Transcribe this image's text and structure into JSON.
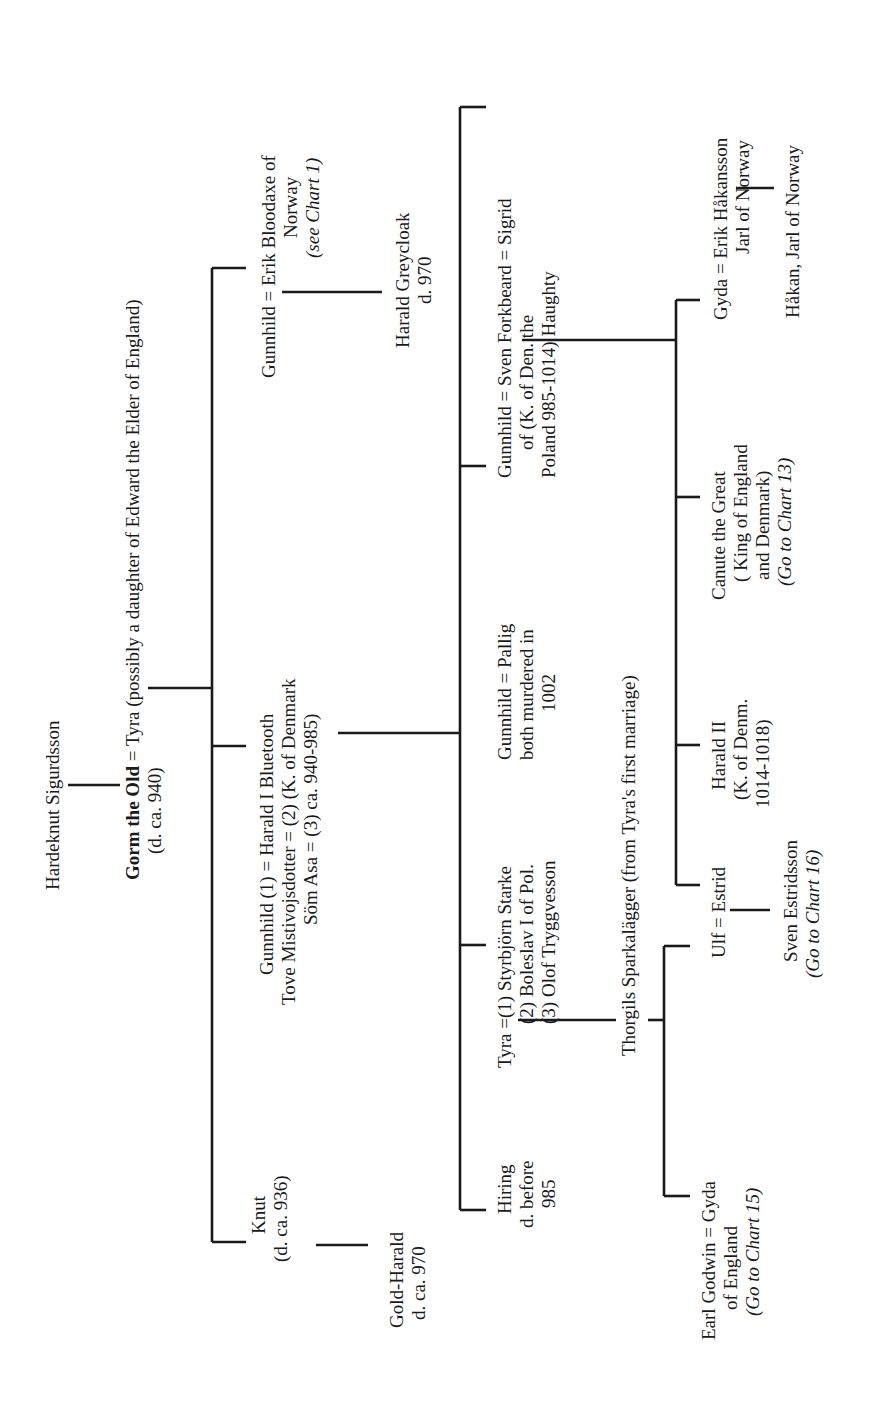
{
  "chart": {
    "type": "genealogy-tree",
    "orientation": "rotated 90 degrees counter-clockwise",
    "line_color": "#1a1a1a",
    "background": "#ffffff"
  },
  "nodes": {
    "hardeknut": {
      "lines": [
        "Hardeknut Sigurdsson"
      ]
    },
    "gorm": {
      "name": "Gorm the Old",
      "eq": "=",
      "spouse": "Tyra (possibly a daughter of Edward the Elder of England)",
      "sub": "(d. ca. 940)"
    },
    "gunnhild_erik": {
      "lines": [
        "Gunnhild = Erik Bloodaxe of",
        "Norway",
        "(see Chart 1)"
      ]
    },
    "harald_greycloak": {
      "lines": [
        "Harald Greycloak",
        "d. 970"
      ]
    },
    "harald_bluetooth": {
      "lines": [
        "Gunnhild (1)  =  Harald I  Bluetooth",
        "Tove Mistivojsdotter = (2)      (K. of Denmark",
        "Söm Asa = (3)       ca. 940-985)"
      ]
    },
    "knut": {
      "lines": [
        "Knut",
        "(d. ca. 936)"
      ]
    },
    "gold_harald": {
      "lines": [
        "Gold-Harald",
        "d. ca. 970"
      ]
    },
    "sven_forkbeard": {
      "lines": [
        "Gunnhild  =  Sven Forkbeard  = Sigrid",
        "of          (K. of Den.          the",
        "Poland          985-1014)       Haughty"
      ]
    },
    "gunnhild_pallig": {
      "lines": [
        "Gunnhild = Pallig",
        "both murdered in",
        "1002"
      ]
    },
    "tyra_marriages": {
      "lines": [
        "Tyra =(1)  Styrbjörn  Starke",
        "(2) Boleslav I  of Pol.",
        "(3) Olof Tryggvesson"
      ]
    },
    "hiring": {
      "lines": [
        "Hiring",
        "d. before",
        "985"
      ]
    },
    "thorgils": {
      "lines": [
        "Thorgils Sparkalägger (from Tyra's first marriage)"
      ]
    },
    "gyda_erik": {
      "lines": [
        "Gyda = Erik Håkansson",
        "Jarl of Norway"
      ]
    },
    "hakan": {
      "lines": [
        "Håkan, Jarl of Norway"
      ]
    },
    "canute": {
      "lines": [
        "Canute the Great",
        "( King of England",
        "and Denmark)",
        "(Go to Chart 13)"
      ]
    },
    "harald_ii": {
      "lines": [
        "Harald II",
        "(K. of Denm.",
        "1014-1018)"
      ]
    },
    "ulf_estrid": {
      "lines": [
        "Ulf  = Estrid"
      ]
    },
    "sven_estridsson": {
      "lines": [
        "Sven Estridsson",
        "(Go to Chart 16)"
      ]
    },
    "earl_godwin": {
      "lines": [
        "Earl Godwin =  Gyda",
        "of England",
        "(Go to Chart 15)"
      ]
    }
  }
}
